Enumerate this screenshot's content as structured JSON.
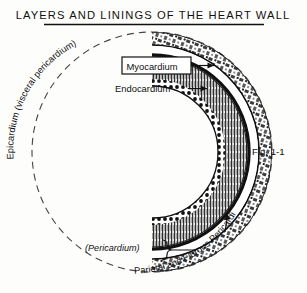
{
  "title": "LAYERS AND LININGS OF THE HEART WALL",
  "figure_caption": "Fig. 1-1",
  "labels": {
    "epicardium_curved": "Epicardium (visceral  pericardium)",
    "myocardium": "Myocardium",
    "endocardium": "Endocardium",
    "pericardium_paren": "(Pericardium)",
    "parietal_fibrous_curved": "Parietal and Fibrous Pericardium"
  },
  "colors": {
    "ink": "#111111",
    "paper": "#fdfdfb",
    "layer_dark": "#1a1a1a",
    "layer_mid": "#555555",
    "layer_light": "#bbbbbb"
  },
  "icons": {
    "arrow": "arrow-right-icon",
    "bracket": "curly-brace-icon",
    "dashed_arc": "dashed-arc-icon"
  },
  "diagram": {
    "type": "anatomical-cross-section",
    "subject": "heart wall",
    "layers_outer_to_inner": [
      "Parietal and Fibrous Pericardium",
      "pericardial cavity",
      "Epicardium (visceral pericardium)",
      "Myocardium",
      "Endocardium"
    ]
  }
}
